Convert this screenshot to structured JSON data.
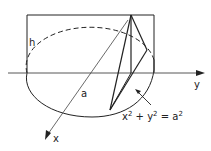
{
  "diagram": {
    "type": "geometry-figure",
    "labels": {
      "height": "h",
      "radius": "a",
      "x_axis": "x",
      "y_axis": "y",
      "equation_base": "x",
      "equation_plus": " + y",
      "equation_eq": " = a",
      "equation_exp": "2"
    },
    "equation_full": "x² + y² = a²",
    "colors": {
      "stroke": "#222222",
      "axis": "#444444",
      "background": "#ffffff"
    }
  }
}
